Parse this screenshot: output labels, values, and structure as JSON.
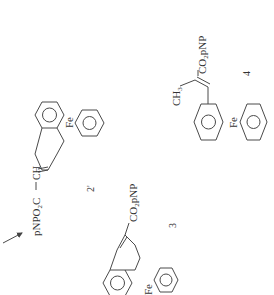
{
  "diagram": {
    "arrow": {
      "direction": "up-right"
    },
    "compounds": [
      {
        "id": "2prime",
        "number_label": "2'",
        "ester_label": "pNPO2C",
        "ester_parts": [
          "pNPO",
          "2",
          "C"
        ],
        "ch_label": "CH",
        "metal_label": "Fe"
      },
      {
        "id": "3",
        "number_label": "3",
        "ester_label": "CO2pNP",
        "ester_parts": [
          "CO",
          "2",
          "pNP"
        ],
        "metal_label": "Fe"
      },
      {
        "id": "4",
        "number_label": "4",
        "ester_label": "CO2pNP",
        "ester_parts": [
          "CO",
          "2",
          "pNP"
        ],
        "methyl_label": "CH3",
        "methyl_parts": [
          "CH",
          "3"
        ],
        "metal_label": "Fe"
      }
    ]
  }
}
